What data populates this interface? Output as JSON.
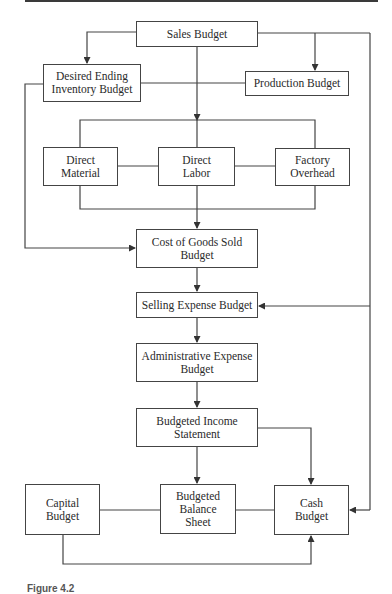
{
  "diagram": {
    "nodes": {
      "sales": "Sales Budget",
      "ending_inventory": "Desired Ending\nInventory Budget",
      "production": "Production Budget",
      "direct_material": "Direct\nMaterial",
      "direct_labor": "Direct\nLabor",
      "factory_overhead": "Factory\nOverhead",
      "cogs": "Cost of Goods Sold\nBudget",
      "selling": "Selling Expense Budget",
      "admin": "Administrative Expense\nBudget",
      "income": "Budgeted Income\nStatement",
      "capital": "Capital\nBudget",
      "balance": "Budgeted\nBalance\nSheet",
      "cash": "Cash\nBudget"
    },
    "edges": [
      [
        "Sales Budget",
        "Desired Ending Inventory Budget"
      ],
      [
        "Sales Budget",
        "Production Budget"
      ],
      [
        "Sales Budget",
        "Direct Material / Direct Labor / Factory Overhead"
      ],
      [
        "Sales Budget",
        "Selling Expense Budget"
      ],
      [
        "Sales Budget",
        "Cash Budget"
      ],
      [
        "Desired Ending Inventory Budget",
        "Cost of Goods Sold Budget"
      ],
      [
        "Direct Material / Direct Labor / Factory Overhead",
        "Cost of Goods Sold Budget"
      ],
      [
        "Cost of Goods Sold Budget",
        "Selling Expense Budget"
      ],
      [
        "Selling Expense Budget",
        "Administrative Expense Budget"
      ],
      [
        "Administrative Expense Budget",
        "Budgeted Income Statement"
      ],
      [
        "Budgeted Income Statement",
        "Budgeted Balance Sheet"
      ],
      [
        "Budgeted Income Statement",
        "Cash Budget"
      ],
      [
        "Capital Budget",
        "Cash Budget"
      ]
    ],
    "caption": "Figure 4.2"
  }
}
